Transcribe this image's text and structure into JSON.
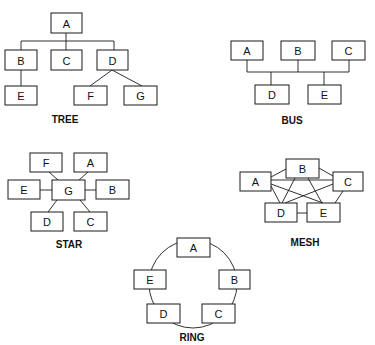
{
  "diagrams": {
    "tree": {
      "title": "TREE",
      "nodes": [
        "A",
        "B",
        "C",
        "D",
        "E",
        "F",
        "G"
      ],
      "edges": [
        [
          "A",
          "B"
        ],
        [
          "A",
          "C"
        ],
        [
          "A",
          "D"
        ],
        [
          "B",
          "E"
        ],
        [
          "D",
          "F"
        ],
        [
          "D",
          "G"
        ]
      ]
    },
    "bus": {
      "title": "BUS",
      "nodes": [
        "A",
        "B",
        "C",
        "D",
        "E"
      ],
      "edges": [
        [
          "bus",
          "A"
        ],
        [
          "bus",
          "B"
        ],
        [
          "bus",
          "C"
        ],
        [
          "bus",
          "D"
        ],
        [
          "bus",
          "E"
        ]
      ]
    },
    "star": {
      "title": "STAR",
      "hub": "G",
      "nodes": [
        "F",
        "A",
        "E",
        "G",
        "B",
        "D",
        "C"
      ],
      "edges": [
        [
          "G",
          "F"
        ],
        [
          "G",
          "A"
        ],
        [
          "G",
          "E"
        ],
        [
          "G",
          "B"
        ],
        [
          "G",
          "D"
        ],
        [
          "G",
          "C"
        ]
      ]
    },
    "mesh": {
      "title": "MESH",
      "nodes": [
        "A",
        "B",
        "C",
        "D",
        "E"
      ],
      "edges": [
        [
          "A",
          "B"
        ],
        [
          "A",
          "C"
        ],
        [
          "A",
          "D"
        ],
        [
          "A",
          "E"
        ],
        [
          "B",
          "C"
        ],
        [
          "B",
          "D"
        ],
        [
          "B",
          "E"
        ],
        [
          "C",
          "D"
        ],
        [
          "C",
          "E"
        ],
        [
          "D",
          "E"
        ]
      ]
    },
    "ring": {
      "title": "RING",
      "nodes": [
        "A",
        "B",
        "C",
        "D",
        "E"
      ],
      "edges": [
        [
          "A",
          "B"
        ],
        [
          "B",
          "C"
        ],
        [
          "C",
          "D"
        ],
        [
          "D",
          "E"
        ],
        [
          "E",
          "A"
        ]
      ]
    }
  }
}
